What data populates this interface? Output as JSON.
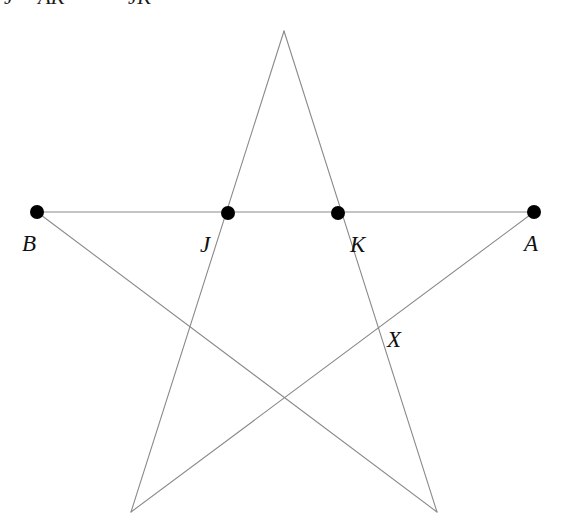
{
  "figure": {
    "name": "pentagram-with-labeled-points",
    "width": 571,
    "height": 531,
    "background_color": "#ffffff",
    "line_color": "#8a8a8a",
    "line_width": 1.1,
    "dot_color": "#000000",
    "dot_radius": 7,
    "label_color": "#111111"
  },
  "clipped_header": {
    "note": "top line of text cut off by image crop; only lower halves of glyphs visible",
    "fragments": [
      {
        "text": "J",
        "x": 4
      },
      {
        "text": "AK",
        "x": 38
      },
      {
        "text": "JK",
        "x": 128
      }
    ]
  },
  "points": [
    {
      "id": "B",
      "label": "B",
      "x": 37,
      "y": 212,
      "dot": true,
      "label_x": 22,
      "label_y": 232
    },
    {
      "id": "J",
      "label": "J",
      "x": 228,
      "y": 213,
      "dot": true,
      "label_x": 200,
      "label_y": 233
    },
    {
      "id": "K",
      "label": "K",
      "x": 338,
      "y": 213,
      "dot": true,
      "label_x": 350,
      "label_y": 233
    },
    {
      "id": "A",
      "label": "A",
      "x": 534,
      "y": 212,
      "dot": true,
      "label_x": 524,
      "label_y": 232
    },
    {
      "id": "X",
      "label": "X",
      "x": 383,
      "y": 325,
      "dot": false,
      "label_x": 387,
      "label_y": 328
    },
    {
      "id": "apex",
      "label": "",
      "x": 284,
      "y": 31,
      "dot": false,
      "label_x": 0,
      "label_y": 0
    },
    {
      "id": "bottom-left",
      "label": "",
      "x": 131,
      "y": 512,
      "dot": false,
      "label_x": 0,
      "label_y": 0
    },
    {
      "id": "bottom-right",
      "label": "",
      "x": 437,
      "y": 512,
      "dot": false,
      "label_x": 0,
      "label_y": 0
    }
  ],
  "chords": [
    {
      "id": "chord-B-A",
      "from": "B",
      "to": "A",
      "x1": 37,
      "y1": 212,
      "x2": 534,
      "y2": 212
    },
    {
      "id": "chord-apex-bottomleft",
      "from": "apex",
      "to": "bottom-left",
      "x1": 284,
      "y1": 31,
      "x2": 131,
      "y2": 512
    },
    {
      "id": "chord-apex-bottomright",
      "from": "apex",
      "to": "bottom-right",
      "x1": 284,
      "y1": 31,
      "x2": 437,
      "y2": 512
    },
    {
      "id": "chord-B-bottomright",
      "from": "B",
      "to": "bottom-right",
      "x1": 37,
      "y1": 212,
      "x2": 437,
      "y2": 512
    },
    {
      "id": "chord-A-bottomleft",
      "from": "A",
      "to": "bottom-left",
      "x1": 534,
      "y1": 212,
      "x2": 131,
      "y2": 512
    }
  ]
}
